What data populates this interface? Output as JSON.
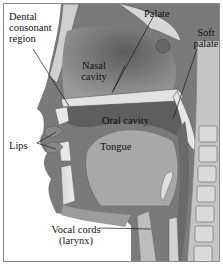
{
  "diagram": {
    "type": "anatomical-cross-section",
    "labels": {
      "dental": [
        "Dental",
        "consonant",
        "region"
      ],
      "palate": "Palate",
      "soft_palate": [
        "Soft",
        "palate"
      ],
      "nasal_cavity": [
        "Nasal",
        "cavity"
      ],
      "oral_cavity": "Oral cavity",
      "lips": "Lips",
      "tongue": "Tongue",
      "vocal_cords": [
        "Vocal cords",
        "(larynx)"
      ]
    },
    "colors": {
      "border": "#8a8a8a",
      "tissue_dark": "#6e6e6e",
      "tissue_mid": "#9a9a9a",
      "tissue_light": "#c8c8c8",
      "bone": "#dcdcdc",
      "leader_line": "#1a1a1a"
    }
  }
}
